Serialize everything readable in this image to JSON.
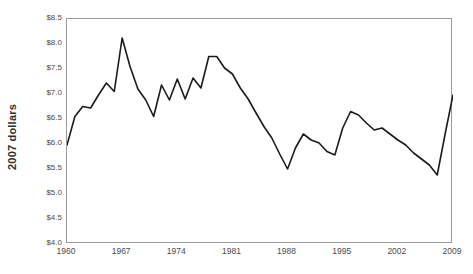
{
  "chart_data": {
    "type": "line",
    "title": "",
    "subtitle": "",
    "xlabel": "",
    "ylabel": "2007 dollars",
    "xlim": [
      1960,
      2009
    ],
    "ylim": [
      4.0,
      8.5
    ],
    "grid": false,
    "legend": false,
    "x_tick_labels": [
      "1960",
      "1967",
      "1974",
      "1981",
      "1988",
      "1995",
      "2002",
      "2009"
    ],
    "x_ticks": [
      1960,
      1967,
      1974,
      1981,
      1988,
      1995,
      2002,
      2009
    ],
    "y_tick_labels": [
      "$4.0",
      "$4.5",
      "$5.0",
      "$5.5",
      "$6.0",
      "$6.5",
      "$7.0",
      "$7.5",
      "$8.0",
      "$8.5"
    ],
    "y_ticks": [
      4.0,
      4.5,
      5.0,
      5.5,
      6.0,
      6.5,
      7.0,
      7.5,
      8.0,
      8.5
    ],
    "line_color": "#1a1a1a",
    "axis_color": "#9a9a9a",
    "x": [
      1960,
      1961,
      1962,
      1963,
      1964,
      1965,
      1966,
      1967,
      1968,
      1969,
      1970,
      1971,
      1972,
      1973,
      1974,
      1975,
      1976,
      1977,
      1978,
      1979,
      1980,
      1981,
      1982,
      1983,
      1984,
      1985,
      1986,
      1987,
      1988,
      1989,
      1990,
      1991,
      1992,
      1993,
      1994,
      1995,
      1996,
      1997,
      1998,
      1999,
      2000,
      2001,
      2002,
      2003,
      2004,
      2005,
      2006,
      2007,
      2008,
      2009
    ],
    "values": [
      5.98,
      6.55,
      6.75,
      6.72,
      6.98,
      7.22,
      7.05,
      8.12,
      7.55,
      7.1,
      6.88,
      6.55,
      7.18,
      6.88,
      7.3,
      6.9,
      7.32,
      7.12,
      7.75,
      7.75,
      7.52,
      7.4,
      7.12,
      6.9,
      6.62,
      6.35,
      6.12,
      5.8,
      5.5,
      5.92,
      6.2,
      6.08,
      6.02,
      5.85,
      5.78,
      6.32,
      6.65,
      6.58,
      6.42,
      6.28,
      6.32,
      6.2,
      6.08,
      5.98,
      5.82,
      5.7,
      5.58,
      5.38,
      6.2,
      6.98
    ],
    "series": [
      {
        "name": "2007 dollars",
        "values": [
          5.98,
          6.55,
          6.75,
          6.72,
          6.98,
          7.22,
          7.05,
          8.12,
          7.55,
          7.1,
          6.88,
          6.55,
          7.18,
          6.88,
          7.3,
          6.9,
          7.32,
          7.12,
          7.75,
          7.75,
          7.52,
          7.4,
          7.12,
          6.9,
          6.62,
          6.35,
          6.12,
          5.8,
          5.5,
          5.92,
          6.2,
          6.08,
          6.02,
          5.85,
          5.78,
          6.32,
          6.65,
          6.58,
          6.42,
          6.28,
          6.32,
          6.2,
          6.08,
          5.98,
          5.82,
          5.7,
          5.58,
          5.38,
          6.2,
          6.98
        ]
      }
    ],
    "annotations": []
  },
  "axes": {
    "y_title": "2007 dollars"
  }
}
